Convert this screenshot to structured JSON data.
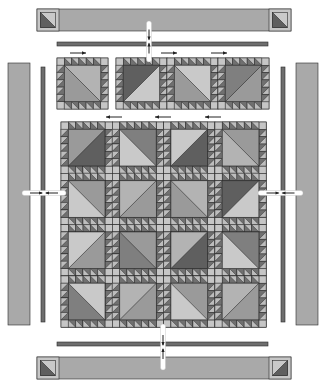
{
  "diagram": {
    "colors": {
      "background": "#ffffff",
      "outline": "#2a2a2a",
      "border_fill": "#a9a9a9",
      "sashing_strip": "#6e6e6e",
      "light": "#c9c9c9",
      "medium_light": "#b3b3b3",
      "medium": "#9a9a9a",
      "medium_dark": "#7f7f7f",
      "dark": "#5f5f5f",
      "sawtooth_light": "#bdbdbd",
      "sawtooth_dark": "#707070",
      "corner_square": "#c6c6c6",
      "arrow": "#222222",
      "seam_highlight": "#ffffff"
    },
    "borders": {
      "top": {
        "x": 37,
        "y": 9,
        "w": 254,
        "h": 22,
        "corner_left_w": 22,
        "corner_right_w": 22
      },
      "bottom": {
        "x": 37,
        "y": 357,
        "w": 254,
        "h": 22,
        "corner_left_w": 22,
        "corner_right_w": 22
      },
      "left": {
        "x": 8,
        "y": 63,
        "w": 22,
        "h": 262
      },
      "right": {
        "x": 296,
        "y": 63,
        "w": 22,
        "h": 262
      }
    },
    "inner_strips": {
      "top": {
        "x": 57,
        "y": 42,
        "w": 211,
        "h": 4
      },
      "bottom": {
        "x": 57,
        "y": 342,
        "w": 211,
        "h": 4
      },
      "left": {
        "x": 41,
        "y": 67,
        "w": 4,
        "h": 255
      },
      "right": {
        "x": 281,
        "y": 67,
        "w": 4,
        "h": 255
      }
    },
    "top_row": {
      "single_block": {
        "x": 57,
        "y": 58,
        "size": 51,
        "tone": [
          "medium_light",
          "medium"
        ],
        "diag": "tl-br"
      },
      "strip": {
        "x": 116,
        "y": 58,
        "block_size": 51,
        "blocks": [
          {
            "tone": [
              "dark",
              "light"
            ],
            "diag": "bl-tr"
          },
          {
            "tone": [
              "light",
              "medium"
            ],
            "diag": "tl-br"
          },
          {
            "tone": [
              "medium_dark",
              "medium"
            ],
            "diag": "bl-tr"
          }
        ]
      },
      "arrows": [
        {
          "x1": 70,
          "x2": 86,
          "y": 53,
          "dir": "right"
        },
        {
          "x1": 161,
          "x2": 177,
          "y": 53,
          "dir": "right"
        },
        {
          "x1": 211,
          "x2": 227,
          "y": 53,
          "dir": "right"
        }
      ]
    },
    "center_grid": {
      "x": 61,
      "y": 122,
      "block_size": 51.3,
      "rows": 4,
      "cols": 4,
      "blocks": [
        [
          {
            "tone": [
              "medium",
              "dark"
            ],
            "diag": "bl-tr"
          },
          {
            "tone": [
              "medium_dark",
              "light"
            ],
            "diag": "tl-br"
          },
          {
            "tone": [
              "light",
              "dark"
            ],
            "diag": "bl-tr"
          },
          {
            "tone": [
              "medium",
              "medium_light"
            ],
            "diag": "tl-br"
          }
        ],
        [
          {
            "tone": [
              "medium",
              "light"
            ],
            "diag": "tl-br"
          },
          {
            "tone": [
              "medium_light",
              "medium"
            ],
            "diag": "bl-tr"
          },
          {
            "tone": [
              "medium_light",
              "medium"
            ],
            "diag": "tl-br"
          },
          {
            "tone": [
              "dark",
              "light"
            ],
            "diag": "bl-tr"
          }
        ],
        [
          {
            "tone": [
              "light",
              "medium"
            ],
            "diag": "bl-tr"
          },
          {
            "tone": [
              "medium",
              "medium_dark"
            ],
            "diag": "tl-br"
          },
          {
            "tone": [
              "medium_light",
              "dark"
            ],
            "diag": "bl-tr"
          },
          {
            "tone": [
              "medium_dark",
              "light"
            ],
            "diag": "tl-br"
          }
        ],
        [
          {
            "tone": [
              "light",
              "medium_dark"
            ],
            "diag": "tl-br"
          },
          {
            "tone": [
              "medium_light",
              "medium"
            ],
            "diag": "bl-tr"
          },
          {
            "tone": [
              "medium",
              "light"
            ],
            "diag": "tl-br"
          },
          {
            "tone": [
              "medium_light",
              "medium"
            ],
            "diag": "bl-tr"
          }
        ]
      ],
      "arrows": [
        {
          "x1": 106,
          "x2": 122,
          "y": 117,
          "dir": "left"
        },
        {
          "x1": 155,
          "x2": 171,
          "y": 117,
          "dir": "left"
        },
        {
          "x1": 205,
          "x2": 221,
          "y": 117,
          "dir": "left"
        }
      ]
    },
    "joins": {
      "vertical": [
        {
          "x": 149,
          "y1": 21,
          "y2": 62,
          "note": "top border to center"
        },
        {
          "x": 163,
          "y1": 324,
          "y2": 370,
          "note": "center to bottom border"
        }
      ],
      "horizontal": [
        {
          "y": 193,
          "x1": 22,
          "x2": 66,
          "note": "left border to center"
        },
        {
          "y": 193,
          "x1": 258,
          "x2": 303,
          "note": "center to right border"
        }
      ]
    },
    "sawtooth": {
      "units_per_side": 5
    }
  }
}
